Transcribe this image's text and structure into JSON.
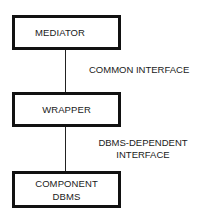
{
  "diagram": {
    "nodes": [
      {
        "id": "mediator",
        "label": "MEDIATOR"
      },
      {
        "id": "wrapper",
        "label": "WRAPPER"
      },
      {
        "id": "component",
        "label_line1": "COMPONENT",
        "label_line2": "DBMS"
      }
    ],
    "edges": [
      {
        "from": "mediator",
        "to": "wrapper",
        "label": "COMMON INTERFACE"
      },
      {
        "from": "wrapper",
        "to": "component",
        "label_line1": "DBMS-DEPENDENT",
        "label_line2": "INTERFACE"
      }
    ]
  }
}
